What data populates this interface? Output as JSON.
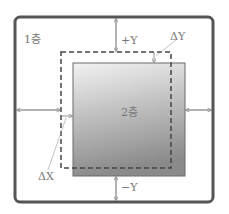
{
  "diagram": {
    "floor1_label": "1층",
    "floor2_label": "2층",
    "plus_y_label": "+Y",
    "minus_y_label": "−Y",
    "delta_y_label": "ΔY",
    "delta_x_label": "ΔX"
  },
  "colors": {
    "frame": "#555555",
    "dashed": "#444444",
    "floor2_top": "#f0f0f0",
    "floor2_bottom": "#8c8c8c",
    "arrows": "#888888",
    "text": "#777777"
  }
}
